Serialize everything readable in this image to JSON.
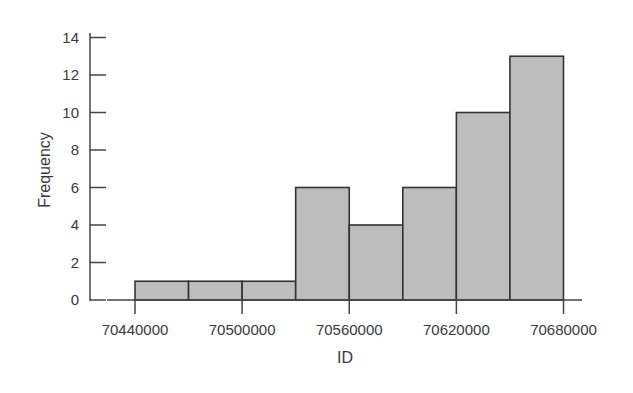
{
  "chart_data": {
    "type": "bar",
    "subtype": "histogram",
    "title": "",
    "xlabel": "ID",
    "ylabel": "Frequency",
    "bin_width": 30000,
    "bin_edges": [
      70440000,
      70470000,
      70500000,
      70530000,
      70560000,
      70590000,
      70620000,
      70650000,
      70680000
    ],
    "categories": [
      "70440000-70470000",
      "70470000-70500000",
      "70500000-70530000",
      "70530000-70560000",
      "70560000-70590000",
      "70590000-70620000",
      "70620000-70650000",
      "70650000-70680000"
    ],
    "values": [
      1,
      1,
      1,
      6,
      4,
      6,
      10,
      13
    ],
    "x_ticks": [
      "70440000",
      "70500000",
      "70560000",
      "70620000",
      "70680000"
    ],
    "x_tick_values": [
      70440000,
      70500000,
      70560000,
      70620000,
      70680000
    ],
    "y_ticks": [
      0,
      2,
      4,
      6,
      8,
      10,
      12,
      14
    ],
    "ylim": [
      0,
      14
    ],
    "xlim": [
      70430000,
      70690000
    ],
    "grid": false,
    "legend": null,
    "bar_color": "#bdbdbd",
    "edge_color": "#333333"
  }
}
